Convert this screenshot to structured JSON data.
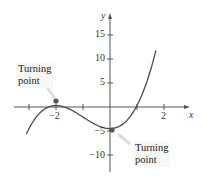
{
  "chart_data": {
    "type": "line",
    "title": "",
    "xlabel": "x",
    "ylabel": "y",
    "xlim": [
      -3.5,
      2.9
    ],
    "ylim": [
      -13,
      20
    ],
    "grid": false,
    "x_ticks": [
      -3,
      -2,
      -1,
      0,
      1,
      2
    ],
    "x_tick_labels": [
      {
        "value": -2,
        "label": "−2"
      },
      {
        "value": 2,
        "label": "2"
      }
    ],
    "y_ticks": [
      -10,
      -5,
      5,
      10,
      15
    ],
    "y_tick_labels": [
      {
        "value": 15,
        "label": "15"
      },
      {
        "value": 10,
        "label": "10"
      },
      {
        "value": 5,
        "label": "5"
      },
      {
        "value": -5,
        "label": "−5"
      },
      {
        "value": -10,
        "label": "−10"
      }
    ],
    "series": [
      {
        "name": "cubic",
        "function_approx": "y ≈ 1.2x^3 + 3.6x^2 - 4.5",
        "x": [
          -3.1,
          -2.8,
          -2.5,
          -2.2,
          -2.0,
          -1.7,
          -1.4,
          -1.1,
          -0.8,
          -0.5,
          -0.2,
          0.0,
          0.3,
          0.6,
          0.9,
          1.2,
          1.45,
          1.7
        ],
        "y": [
          -12.7,
          -8.6,
          -3.75,
          -0.85,
          0.3,
          -0.0,
          -1.74,
          -1.76,
          -2.8,
          -3.75,
          -4.36,
          -4.5,
          -4.14,
          -2.94,
          -0.71,
          2.76,
          6.74,
          11.8
        ]
      }
    ],
    "markers": [
      {
        "x": -2,
        "y": 0.5,
        "label": "Turning point"
      },
      {
        "x": 0,
        "y": -4.5,
        "label": "Turning point"
      }
    ],
    "annotations": [
      {
        "text": "Turning point",
        "target": "local maximum at x=-2"
      },
      {
        "text": "Turning point",
        "target": "local minimum at x=0"
      }
    ],
    "colors": {
      "curve": "#4a4a4a",
      "axis": "#555555",
      "marker": "#555555",
      "callout_bg": "#f2f2f2"
    }
  },
  "labels": {
    "callout_max_line1": "Turning",
    "callout_max_line2": "point",
    "callout_min_line1": "Turning",
    "callout_min_line2": "point",
    "x_axis": "x",
    "y_axis": "y"
  }
}
